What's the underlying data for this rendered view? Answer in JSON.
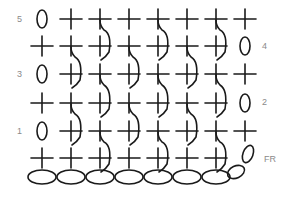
{
  "colors": {
    "stroke": "#1a1a1a",
    "label": "#8a8a8a"
  },
  "columns_x": [
    42,
    71,
    100,
    129,
    158,
    187,
    216,
    245
  ],
  "row_labels": [
    {
      "text": "5",
      "x": 17,
      "y": 15
    },
    {
      "text": "4",
      "x": 262,
      "y": 42
    },
    {
      "text": "3",
      "x": 17,
      "y": 70
    },
    {
      "text": "2",
      "x": 262,
      "y": 98
    },
    {
      "text": "1",
      "x": 17,
      "y": 127
    },
    {
      "text": "FR",
      "x": 264,
      "y": 155
    }
  ],
  "rows": [
    {
      "name": "row-5",
      "y": 19,
      "turning_chain_col": 0,
      "crosses": [
        1,
        2,
        3,
        4,
        5,
        6,
        7
      ],
      "post_stitch_cols": [
        2,
        4,
        6
      ]
    },
    {
      "name": "row-4",
      "y": 46,
      "turning_chain_col": 7,
      "crosses": [
        0,
        1,
        2,
        3,
        4,
        5,
        6
      ],
      "post_stitch_cols": [
        1,
        3,
        5
      ]
    },
    {
      "name": "row-3",
      "y": 74,
      "turning_chain_col": 0,
      "crosses": [
        1,
        2,
        3,
        4,
        5,
        6,
        7
      ],
      "post_stitch_cols": [
        2,
        4,
        6
      ]
    },
    {
      "name": "row-2",
      "y": 103,
      "turning_chain_col": 7,
      "crosses": [
        0,
        1,
        2,
        3,
        4,
        5,
        6
      ],
      "post_stitch_cols": [
        1,
        3,
        5
      ]
    },
    {
      "name": "row-1",
      "y": 131,
      "turning_chain_col": 0,
      "crosses": [
        1,
        2,
        3,
        4,
        5,
        6,
        7
      ],
      "post_stitch_cols": [
        2,
        4,
        6
      ]
    },
    {
      "name": "foundation-row",
      "y": 158,
      "turning_chain_col": null,
      "crosses": [
        0,
        1,
        2,
        3,
        4,
        5,
        6
      ],
      "post_stitch_cols": []
    }
  ],
  "foundation_chain": {
    "y": 177,
    "count": 7,
    "rx": 14,
    "ry": 7
  },
  "legend": {
    "cross": "single crochet",
    "oval": "chain stitch",
    "arc": "front post stitch"
  }
}
